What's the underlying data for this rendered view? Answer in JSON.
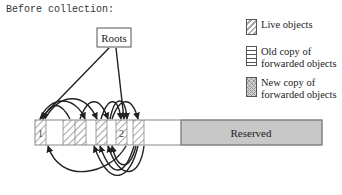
{
  "title": "Before collection:",
  "roots_label": "Roots",
  "reserved_label": "Reserved",
  "object_labels": [
    "1",
    "2"
  ],
  "legend": [
    {
      "label_lines": [
        "Live objects"
      ],
      "pattern": "diagonal-hatch"
    },
    {
      "label_lines": [
        "Old copy of",
        "forwarded objects"
      ],
      "pattern": "horizontal-lines"
    },
    {
      "label_lines": [
        "New copy of",
        "forwarded objects"
      ],
      "pattern": "crosshatch"
    }
  ],
  "heap_segments": [
    {
      "x": 35,
      "w": 11,
      "type": "live",
      "label": "1"
    },
    {
      "x": 46,
      "w": 17,
      "type": "free"
    },
    {
      "x": 63,
      "w": 12,
      "type": "live"
    },
    {
      "x": 75,
      "w": 11,
      "type": "live"
    },
    {
      "x": 86,
      "w": 10,
      "type": "free"
    },
    {
      "x": 96,
      "w": 11,
      "type": "live"
    },
    {
      "x": 107,
      "w": 9,
      "type": "free"
    },
    {
      "x": 116,
      "w": 11,
      "type": "live",
      "label": "2"
    },
    {
      "x": 127,
      "w": 6,
      "type": "free"
    },
    {
      "x": 133,
      "w": 11,
      "type": "live"
    },
    {
      "x": 144,
      "w": 37,
      "type": "free"
    },
    {
      "x": 181,
      "w": 141,
      "type": "reserved"
    }
  ],
  "colors": {
    "hatch": "#aaaaaa",
    "reserved_fill": "#c8c8c8",
    "stroke": "#222222",
    "bar_border": "#888888"
  }
}
